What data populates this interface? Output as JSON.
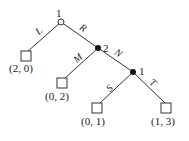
{
  "diagram": {
    "type": "game-tree",
    "nodes": [
      {
        "id": "root",
        "player": "1",
        "style": "hollow"
      },
      {
        "id": "n2",
        "player": "2",
        "style": "filled"
      },
      {
        "id": "n3",
        "player": "1",
        "style": "filled"
      }
    ],
    "edges": [
      {
        "from": "root",
        "to": "leafL",
        "label": "L"
      },
      {
        "from": "root",
        "to": "n2",
        "label": "R"
      },
      {
        "from": "n2",
        "to": "leafM",
        "label": "M"
      },
      {
        "from": "n2",
        "to": "n3",
        "label": "N"
      },
      {
        "from": "n3",
        "to": "leafS",
        "label": "S"
      },
      {
        "from": "n3",
        "to": "leafT",
        "label": "T"
      }
    ],
    "leaves": [
      {
        "id": "leafL",
        "payoff": "(2, 0)"
      },
      {
        "id": "leafM",
        "payoff": "(0, 2)"
      },
      {
        "id": "leafS",
        "payoff": "(0, 1)"
      },
      {
        "id": "leafT",
        "payoff": "(1, 3)"
      }
    ]
  }
}
